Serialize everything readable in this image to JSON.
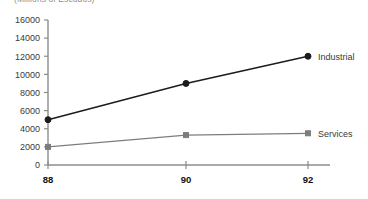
{
  "chart_data": {
    "type": "line",
    "title": "(Millions of Escudos)",
    "xlabel": "",
    "ylabel": "",
    "x": [
      "88",
      "90",
      "92"
    ],
    "categories": [
      "88",
      "90",
      "92"
    ],
    "series": [
      {
        "name": "Industrial",
        "values": [
          5000,
          9000,
          12000
        ],
        "color": "#1c1c1c",
        "marker": "circle"
      },
      {
        "name": "Services",
        "values": [
          2000,
          3300,
          3500
        ],
        "color": "#7d7d7d",
        "marker": "square"
      }
    ],
    "yticks": [
      0,
      2000,
      4000,
      6000,
      8000,
      10000,
      12000,
      14000,
      16000
    ],
    "ytick_labels": [
      "0",
      "2000",
      "4000",
      "6000",
      "8000",
      "10000",
      "12000",
      "14000",
      "16000"
    ],
    "xtick_labels": [
      "88",
      "90",
      "92"
    ],
    "ylim": [
      0,
      16000
    ],
    "grid": false,
    "legend_position": "right-inline",
    "axis_color": "#8c8c8c",
    "background": "#ffffff"
  }
}
